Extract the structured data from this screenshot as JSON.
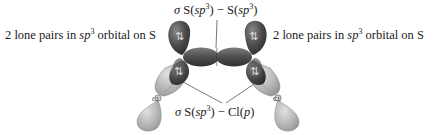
{
  "diagram": {
    "labels": {
      "top": {
        "sigma": "σ",
        "atom1": "S(",
        "orb1_base": "sp",
        "orb1_exp": "3",
        "close1": ")",
        "dash": " − ",
        "atom2": "S(",
        "orb2_base": "sp",
        "orb2_exp": "3",
        "close2": ")"
      },
      "left": {
        "prefix": "2 lone pairs in ",
        "orb_base": "sp",
        "orb_exp": "3",
        "suffix": " orbital on S"
      },
      "right": {
        "prefix": "2 lone pairs in ",
        "orb_base": "sp",
        "orb_exp": "3",
        "suffix": " orbital on S"
      },
      "bottom": {
        "sigma": "σ",
        "atom1": "S(",
        "orb1_base": "sp",
        "orb1_exp": "3",
        "close1": ")",
        "dash": " − ",
        "atom2": "Cl(",
        "orb2_base": "p",
        "close2": ")"
      }
    },
    "atoms": {
      "cl_left": "Cl",
      "cl_right": "Cl"
    },
    "lone_pair_glyph": "⇅",
    "colors": {
      "dark_lobe": "#4a4a4a",
      "mid_lobe": "#6b6b6b",
      "light_lobe": "#a9a9a9",
      "leader_line": "#555555",
      "text": "#1a1a1a"
    }
  }
}
